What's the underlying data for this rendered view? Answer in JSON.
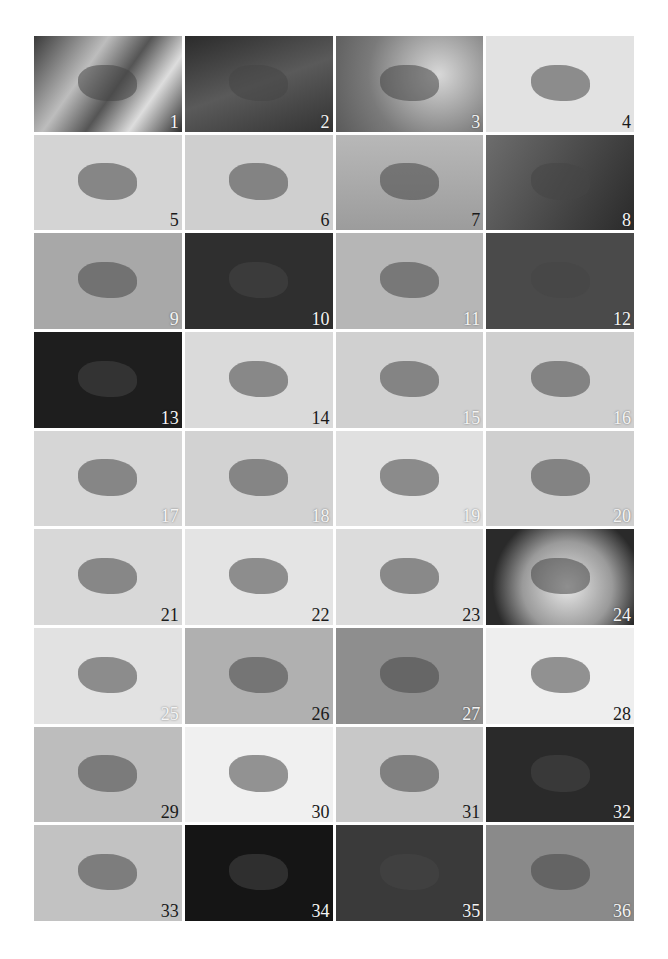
{
  "plate": {
    "columns": 4,
    "rows": 9,
    "panels": [
      {
        "n": "1",
        "subject": "pine needles",
        "bg": "linear-gradient(125deg,#3a3a3a 0%,#bdbdbd 35%,#555 55%,#ddd 75%,#2e2e2e 100%)",
        "num_dark": false
      },
      {
        "n": "2",
        "subject": "mottled moth on pine needles",
        "bg": "linear-gradient(160deg,#2b2b2b,#5a5a5a 50%,#333)",
        "num_dark": false
      },
      {
        "n": "3",
        "subject": "moth on flower stem",
        "bg": "radial-gradient(circle at 70% 40%,#d8d8d8,#7a7a7a 60%,#5a5a5a)",
        "num_dark": false
      },
      {
        "n": "4",
        "subject": "dark moth on fabric",
        "bg": "#e2e2e2",
        "num_dark": true
      },
      {
        "n": "5",
        "subject": "pale moth on fabric",
        "bg": "#d4d4d4",
        "num_dark": true
      },
      {
        "n": "6",
        "subject": "banded caterpillar",
        "bg": "#cfcfcf",
        "num_dark": true
      },
      {
        "n": "7",
        "subject": "leaf fold shelter",
        "bg": "linear-gradient(180deg,#b8b8b8,#9c9c9c)",
        "num_dark": true
      },
      {
        "n": "8",
        "subject": "pale leaf fold on dark background",
        "bg": "linear-gradient(120deg,#6d6d6d,#2a2a2a)",
        "num_dark": false
      },
      {
        "n": "9",
        "subject": "cocoon on surface",
        "bg": "#a8a8a8",
        "num_dark": false
      },
      {
        "n": "10",
        "subject": "spiny larva on dark leaf",
        "bg": "#2f2f2f",
        "num_dark": false
      },
      {
        "n": "11",
        "subject": "pale spiny larva",
        "bg": "#b6b6b6",
        "num_dark": false
      },
      {
        "n": "12",
        "subject": "larva in webbing",
        "bg": "#4a4a4a",
        "num_dark": false
      },
      {
        "n": "13",
        "subject": "white cocoon on dark leaf",
        "bg": "#1e1e1e",
        "num_dark": false
      },
      {
        "n": "14",
        "subject": "moth with spread wings on fabric",
        "bg": "#dadada",
        "num_dark": true
      },
      {
        "n": "15",
        "subject": "dark banded moth",
        "bg": "#d0d0d0",
        "num_dark": false
      },
      {
        "n": "16",
        "subject": "moth with spread wings",
        "bg": "#cfcfcf",
        "num_dark": false
      },
      {
        "n": "17",
        "subject": "delta moth on fabric",
        "bg": "#d6d6d6",
        "num_dark": false
      },
      {
        "n": "18",
        "subject": "two mating moths",
        "bg": "#d2d2d2",
        "num_dark": false
      },
      {
        "n": "19",
        "subject": "small moth on smooth surface",
        "bg": "#e0e0e0",
        "num_dark": false
      },
      {
        "n": "20",
        "subject": "triangular moth",
        "bg": "#cfcfcf",
        "num_dark": false
      },
      {
        "n": "21",
        "subject": "brown moth on fabric",
        "bg": "#d8d8d8",
        "num_dark": true
      },
      {
        "n": "22",
        "subject": "mottled moth",
        "bg": "#e4e4e4",
        "num_dark": true
      },
      {
        "n": "23",
        "subject": "dark moth with long antennae",
        "bg": "#dcdcdc",
        "num_dark": true
      },
      {
        "n": "24",
        "subject": "woven cocoon",
        "bg": "radial-gradient(circle at 55% 60%,#e8e8e8 0%,#9a9a9a 45%,#2a2a2a 75%)",
        "num_dark": false
      },
      {
        "n": "25",
        "subject": "knobbed caterpillar on twig",
        "bg": "#e2e2e2",
        "num_dark": false
      },
      {
        "n": "26",
        "subject": "caterpillar on leaf",
        "bg": "#b0b0b0",
        "num_dark": true
      },
      {
        "n": "27",
        "subject": "curled caterpillar",
        "bg": "#8e8e8e",
        "num_dark": false
      },
      {
        "n": "28",
        "subject": "looper on stem",
        "bg": "#eeeeee",
        "num_dark": true
      },
      {
        "n": "29",
        "subject": "larva on leaf veins",
        "bg": "#bdbdbd",
        "num_dark": true
      },
      {
        "n": "30",
        "subject": "twig-like larva",
        "bg": "#f0f0f0",
        "num_dark": true
      },
      {
        "n": "31",
        "subject": "larva among pine needles",
        "bg": "#c8c8c8",
        "num_dark": true
      },
      {
        "n": "32",
        "subject": "larva on fuzzy leaf edge",
        "bg": "#2a2a2a",
        "num_dark": false
      },
      {
        "n": "33",
        "subject": "larva on juniper",
        "bg": "#c2c2c2",
        "num_dark": true
      },
      {
        "n": "34",
        "subject": "inchworm arched on stem",
        "bg": "#151515",
        "num_dark": false
      },
      {
        "n": "35",
        "subject": "larva in curled leaves",
        "bg": "#3a3a3a",
        "num_dark": false
      },
      {
        "n": "36",
        "subject": "larva on leaf midrib",
        "bg": "#8a8a8a",
        "num_dark": false
      }
    ]
  }
}
